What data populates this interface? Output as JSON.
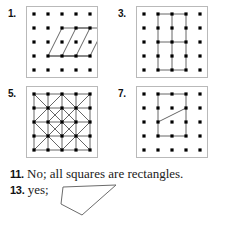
{
  "page": {
    "type": "answer-key",
    "width": 231,
    "height": 226,
    "background": "#ffffff",
    "ink": "#1a1a1a",
    "peg_color": "#000000",
    "frame_color": "#b9b9b9",
    "figure_color": "#555555"
  },
  "exercises": [
    {
      "number": "1.",
      "label_x": 8,
      "label_y": 8,
      "board": {
        "x": 26,
        "y": 6,
        "size": 72,
        "rows": 5,
        "cols": 5
      },
      "description": "two nested parallelograms on a 5 by 5 geoboard",
      "shapes": [
        {
          "kind": "polygon",
          "points": "1,3 2,1 4,1 3,3"
        },
        {
          "kind": "polygon",
          "points": "2,3 3,1 5,1 4,3"
        },
        {
          "kind": "polyline",
          "points": "1,3 3,3 4,3"
        }
      ]
    },
    {
      "number": "3.",
      "label_x": 118,
      "label_y": 8,
      "board": {
        "x": 136,
        "y": 6,
        "size": 72,
        "rows": 5,
        "cols": 5
      },
      "description": "rectangles subdivided by one vertical and one horizontal segment",
      "shapes": [
        {
          "kind": "polygon",
          "points": "1,0 3,0 3,4 1,4"
        },
        {
          "kind": "polyline",
          "points": "2,0 2,4"
        },
        {
          "kind": "polyline",
          "points": "1,2 3,2"
        }
      ]
    },
    {
      "number": "5.",
      "label_x": 8,
      "label_y": 88,
      "board": {
        "x": 26,
        "y": 86,
        "size": 72,
        "rows": 5,
        "cols": 5
      },
      "description": "full square grid with diagonals forming nested squares and triangles",
      "shapes": [
        {
          "kind": "polygon",
          "points": "0,0 4,0 4,4 0,4"
        },
        {
          "kind": "polyline",
          "points": "1,0 1,4"
        },
        {
          "kind": "polyline",
          "points": "2,0 2,4"
        },
        {
          "kind": "polyline",
          "points": "3,0 3,4"
        },
        {
          "kind": "polyline",
          "points": "0,1 4,1"
        },
        {
          "kind": "polyline",
          "points": "0,2 4,2"
        },
        {
          "kind": "polyline",
          "points": "0,3 4,3"
        },
        {
          "kind": "polygon",
          "points": "2,0 4,2 2,4 0,2"
        },
        {
          "kind": "polygon",
          "points": "2,1 3,2 2,3 1,2"
        },
        {
          "kind": "polyline",
          "points": "0,0 2,2"
        },
        {
          "kind": "polyline",
          "points": "2,2 4,4"
        },
        {
          "kind": "polyline",
          "points": "4,0 2,2"
        },
        {
          "kind": "polyline",
          "points": "2,2 0,4"
        }
      ]
    },
    {
      "number": "7.",
      "label_x": 118,
      "label_y": 88,
      "board": {
        "x": 136,
        "y": 86,
        "size": 72,
        "rows": 5,
        "cols": 5
      },
      "description": "rectangle with a diagonal segment forming a trapezoid",
      "shapes": [
        {
          "kind": "polygon",
          "points": "1,0 3,0 3,3 1,3"
        },
        {
          "kind": "polyline",
          "points": "1,2 3,1"
        }
      ]
    }
  ],
  "answers": [
    {
      "number": "11.",
      "text": "No; all squares are rectangles.",
      "x": 10,
      "y": 166
    },
    {
      "number": "13.",
      "text": "yes;",
      "x": 10,
      "y": 182,
      "figure": {
        "name": "quadrilateral-sketch",
        "points": "5,4 58,2 24,32 3,21"
      }
    }
  ]
}
